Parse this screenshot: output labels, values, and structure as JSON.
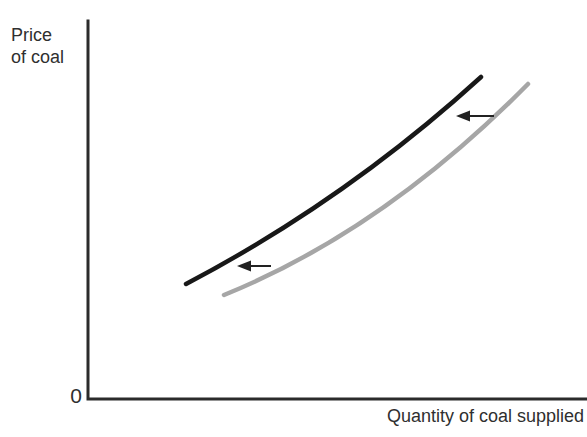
{
  "figure": {
    "background": "#ffffff",
    "text_color": "#2f2f2f",
    "axis_color": "#2b2b2b"
  },
  "chart_data": {
    "type": "line",
    "title": "",
    "ylabel": "Price\nof coal",
    "xlabel": "Quantity of coal supplied",
    "origin_label": "0",
    "axis_tick_labels": [],
    "grid": false,
    "legend": false,
    "axes_path": "M 88 21 L 88 399 L 587 399",
    "series": [
      {
        "name": "supply-after-shift",
        "role": "new supply curve (shifted left)",
        "color": "#181818",
        "stroke_width": 4.5,
        "path": "M 186 284 Q 346 200 481 77",
        "points_norm_xy": [
          [
            0.2,
            0.3
          ],
          [
            0.36,
            0.42
          ],
          [
            0.51,
            0.55
          ],
          [
            0.65,
            0.7
          ],
          [
            0.79,
            0.85
          ]
        ]
      },
      {
        "name": "supply-original",
        "role": "original supply curve",
        "color": "#a6a6a6",
        "stroke_width": 4.5,
        "path": "M 224 295 Q 384 230 528 84",
        "points_norm_xy": [
          [
            0.28,
            0.27
          ],
          [
            0.43,
            0.37
          ],
          [
            0.59,
            0.5
          ],
          [
            0.74,
            0.65
          ],
          [
            0.88,
            0.84
          ]
        ]
      }
    ],
    "annotations": [
      {
        "name": "shift-arrow-upper",
        "direction": "left",
        "color": "#222222",
        "shaft_path": "M 494 116 L 468 116",
        "head_path": "M 456 116 L 470 110.5 L 470 121.5 Z"
      },
      {
        "name": "shift-arrow-lower",
        "direction": "left",
        "color": "#222222",
        "shaft_path": "M 271 266 L 249 266",
        "head_path": "M 237 266 L 251 260.5 L 251 271.5 Z"
      }
    ]
  }
}
